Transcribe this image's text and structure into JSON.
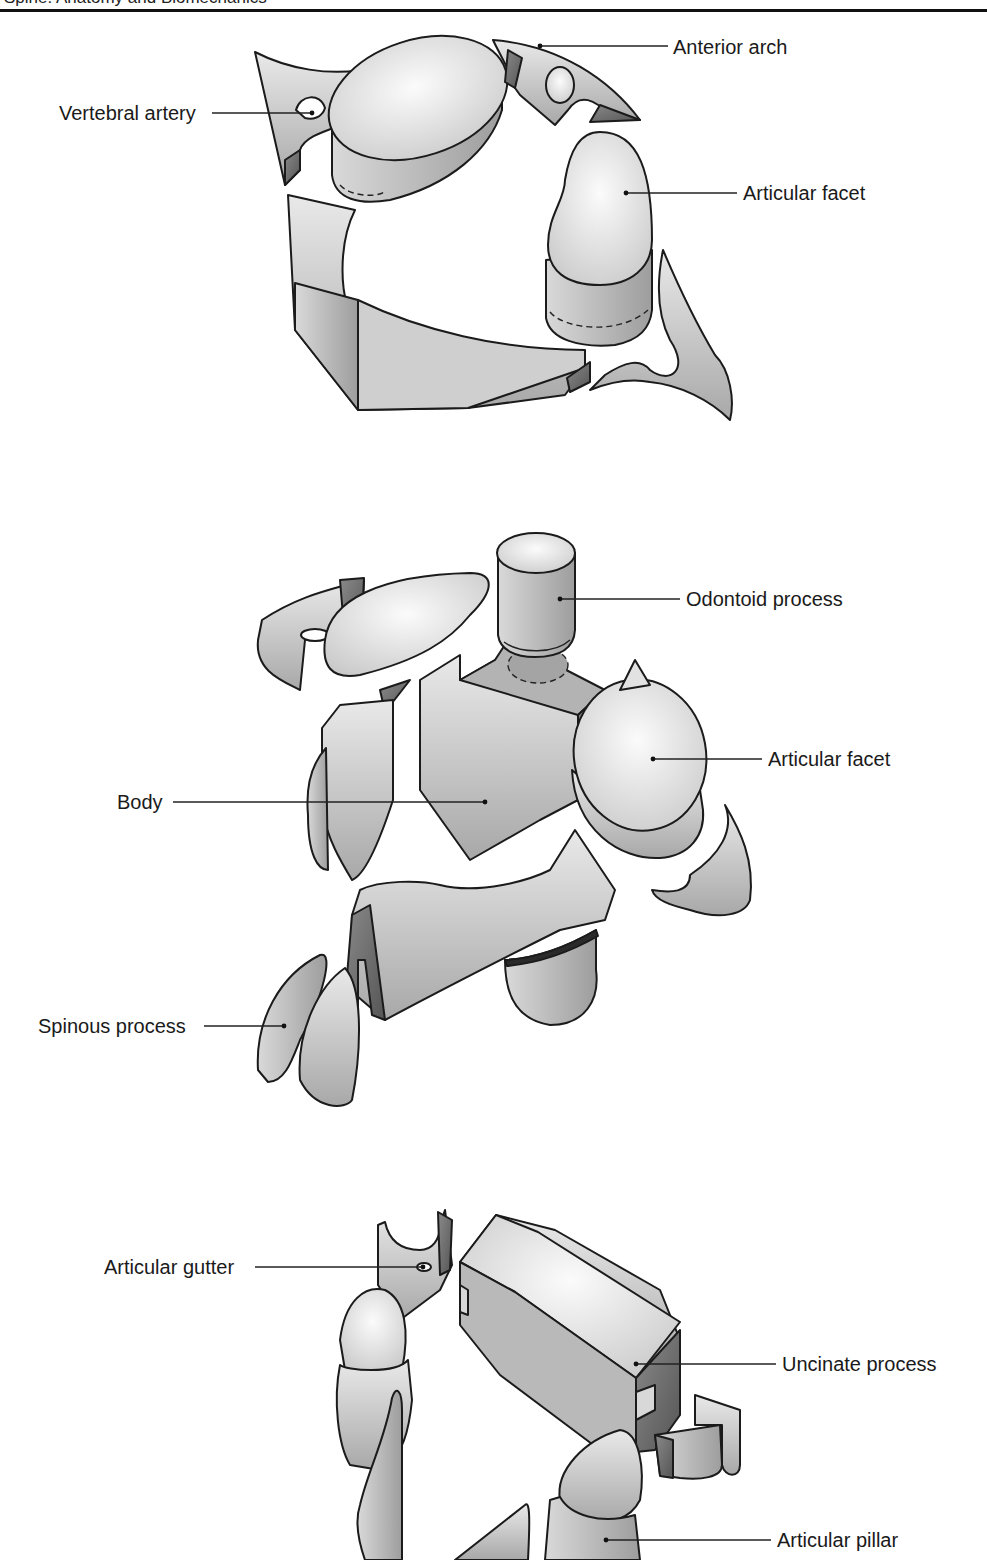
{
  "header": {
    "text": "Spine: Anatomy and Biomechanics"
  },
  "figures": [
    {
      "id": "atlas",
      "labels": [
        {
          "text": "Anterior arch",
          "x": 673,
          "y": 36
        },
        {
          "text": "Vertebral artery",
          "x": 59,
          "y": 101
        },
        {
          "text": "Articular facet",
          "x": 743,
          "y": 181
        }
      ]
    },
    {
      "id": "axis",
      "labels": [
        {
          "text": "Odontoid process",
          "x": 686,
          "y": 588
        },
        {
          "text": "Articular facet",
          "x": 768,
          "y": 747
        },
        {
          "text": "Body",
          "x": 117,
          "y": 791
        },
        {
          "text": "Spinous process",
          "x": 38,
          "y": 1015
        }
      ]
    },
    {
      "id": "lower-cervical",
      "labels": [
        {
          "text": "Articular gutter",
          "x": 104,
          "y": 1255
        },
        {
          "text": "Uncinate process",
          "x": 782,
          "y": 1353
        },
        {
          "text": "Articular pillar",
          "x": 777,
          "y": 1529
        }
      ]
    }
  ],
  "colors": {
    "line": "#1b1b1b",
    "light_fill": "#e6e6e6",
    "mid_fill": "#bdbdbd",
    "dark_fill": "#6e6e6e",
    "background": "#ffffff"
  }
}
